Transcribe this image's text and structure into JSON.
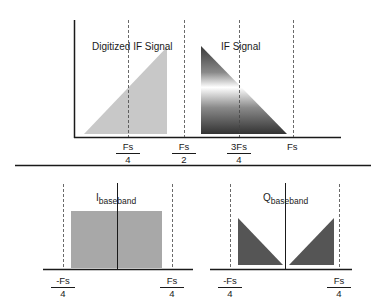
{
  "top_panel": {
    "digitized_label": "Digitized IF Signal",
    "if_label": "IF Signal",
    "ticks": [
      {
        "num": "Fs",
        "den": "4"
      },
      {
        "num": "Fs",
        "den": "2"
      },
      {
        "num": "3Fs",
        "den": "4"
      },
      {
        "plain": "Fs"
      }
    ]
  },
  "bottom_left_panel": {
    "label_main": "I",
    "label_sub": "baseband",
    "ticks": [
      {
        "num": "-Fs",
        "den": "4"
      },
      {
        "num": "Fs",
        "den": "4"
      }
    ]
  },
  "bottom_right_panel": {
    "label_main": "Q",
    "label_sub": "baseband",
    "ticks": [
      {
        "num": "-Fs",
        "den": "4"
      },
      {
        "num": "Fs",
        "den": "4"
      }
    ]
  },
  "colors": {
    "axis": "#1a1a1a",
    "digitized_fill": "#c8c8c8",
    "i_fill": "#a8a8a8",
    "q_fill": "#555555",
    "gradient_dark": "#3a3a3a",
    "gradient_light": "#ffffff"
  }
}
